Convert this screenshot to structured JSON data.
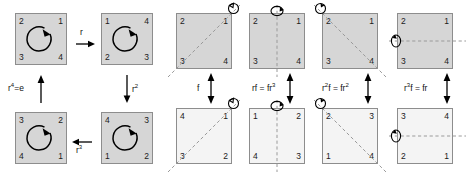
{
  "diagram": {
    "colors": {
      "square_fill_dark": "#d6d6d6",
      "square_fill_light": "#f4f4f4",
      "square_border": "#8d8d8d",
      "axis_line": "#9a9a9a",
      "arrow": "#000000",
      "text": "#111111"
    },
    "rotations_group": {
      "squares": [
        {
          "id": "rot-identity",
          "fill": "dark",
          "corners": {
            "tl": "2",
            "tr": "1",
            "bl": "3",
            "br": "4"
          },
          "marker": "ccw-rotation-arrow"
        },
        {
          "id": "rot-r",
          "fill": "dark",
          "corners": {
            "tl": "1",
            "tr": "4",
            "bl": "2",
            "br": "3"
          },
          "marker": "ccw-rotation-arrow"
        },
        {
          "id": "rot-r2",
          "fill": "dark",
          "corners": {
            "tl": "4",
            "tr": "3",
            "bl": "1",
            "br": "2"
          },
          "marker": "ccw-rotation-arrow"
        },
        {
          "id": "rot-r3",
          "fill": "dark",
          "corners": {
            "tl": "3",
            "tr": "2",
            "bl": "4",
            "br": "1"
          },
          "marker": "ccw-rotation-arrow"
        }
      ],
      "arrows": [
        {
          "id": "arrow-r",
          "label": "r",
          "label_sup": "",
          "direction": "right"
        },
        {
          "id": "arrow-r2",
          "label": "r",
          "label_sup": "2",
          "direction": "down"
        },
        {
          "id": "arrow-r3",
          "label": "r",
          "label_sup": "3",
          "direction": "left"
        },
        {
          "id": "arrow-r4",
          "label": "r",
          "label_sup": "4",
          "label_tail": "=e",
          "direction": "up"
        }
      ]
    },
    "reflections_group": {
      "columns": [
        {
          "id": "refl-f",
          "label": "f",
          "label_sup": "",
          "axis": "diagonal-up",
          "top": {
            "fill": "dark",
            "corners": {
              "tl": "2",
              "tr": "1",
              "bl": "3",
              "br": "4"
            }
          },
          "bottom": {
            "fill": "light",
            "corners": {
              "tl": "4",
              "tr": "1",
              "bl": "3",
              "br": "2"
            }
          }
        },
        {
          "id": "refl-rf",
          "label": "rf = fr",
          "label_sup": "3",
          "axis": "vertical",
          "top": {
            "fill": "dark",
            "corners": {
              "tl": "2",
              "tr": "1",
              "bl": "3",
              "br": "4"
            }
          },
          "bottom": {
            "fill": "light",
            "corners": {
              "tl": "1",
              "tr": "2",
              "bl": "4",
              "br": "3"
            }
          }
        },
        {
          "id": "refl-r2f",
          "label_pre": "r",
          "label_pre_sup": "2",
          "label": "f = fr",
          "label_sup": "2",
          "axis": "diagonal-down",
          "top": {
            "fill": "dark",
            "corners": {
              "tl": "2",
              "tr": "1",
              "bl": "3",
              "br": "4"
            }
          },
          "bottom": {
            "fill": "light",
            "corners": {
              "tl": "2",
              "tr": "3",
              "bl": "1",
              "br": "4"
            }
          }
        },
        {
          "id": "refl-r3f",
          "label_pre": "r",
          "label_pre_sup": "3",
          "label": "f = fr",
          "label_sup": "",
          "axis": "horizontal",
          "top": {
            "fill": "dark",
            "corners": {
              "tl": "2",
              "tr": "1",
              "bl": "3",
              "br": "4"
            }
          },
          "bottom": {
            "fill": "light",
            "corners": {
              "tl": "3",
              "tr": "4",
              "bl": "2",
              "br": "1"
            }
          }
        }
      ]
    }
  }
}
